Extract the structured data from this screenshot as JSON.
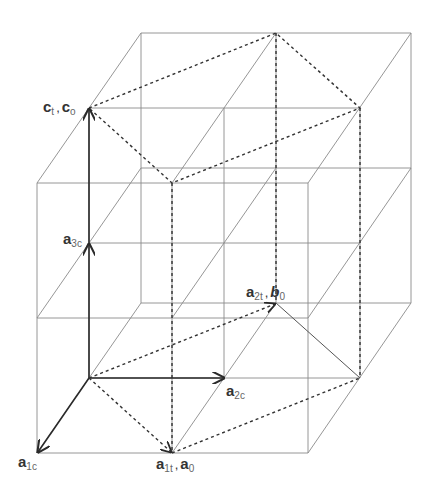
{
  "figure": {
    "colors": {
      "grid": "#8a8a8a",
      "dashed": "#333333",
      "vector": "#2a2a2a",
      "text": "#333333"
    }
  },
  "labels": {
    "c_t_c_o": {
      "v1": "c",
      "s1": "t",
      "sep": ",",
      "v2": "c",
      "s2": "o"
    },
    "a_3c": {
      "v": "a",
      "s": "3c"
    },
    "a_2t_b_0": {
      "v1": "a",
      "s1": "2t",
      "sep": ",",
      "v2": "b",
      "s2": "0"
    },
    "a_2c": {
      "v": "a",
      "s": "2c"
    },
    "a_1c": {
      "v": "a",
      "s": "1c"
    },
    "a_1t_a_0": {
      "v1": "a",
      "s1": "1t",
      "sep": ",",
      "v2": "a",
      "s2": "0"
    }
  },
  "vectors": [
    {
      "name": "a1c",
      "from": [
        89,
        378
      ],
      "to": [
        37,
        453
      ]
    },
    {
      "name": "a2c",
      "from": [
        89,
        378
      ],
      "to": [
        225,
        378
      ]
    },
    {
      "name": "a3c",
      "from": [
        89,
        378
      ],
      "to": [
        89,
        243
      ]
    },
    {
      "name": "c_t",
      "from": [
        89,
        378
      ],
      "to": [
        89,
        108
      ]
    },
    {
      "name": "a1t",
      "from": [
        89,
        378
      ],
      "to": [
        172,
        453
      ]
    },
    {
      "name": "a2t",
      "from": [
        89,
        378
      ],
      "to": [
        276,
        303
      ]
    }
  ]
}
